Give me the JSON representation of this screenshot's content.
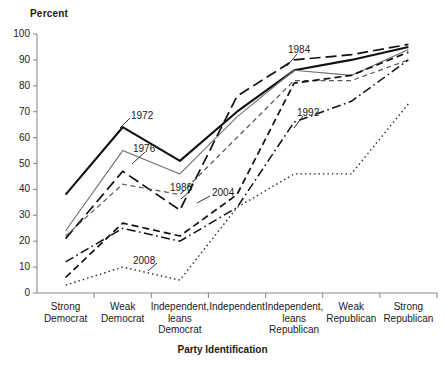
{
  "chart_data": {
    "type": "line",
    "title": "",
    "ylabel": "Percent",
    "xlabel": "Party Identification",
    "ylim": [
      0,
      100
    ],
    "ytick_labels": [
      "100",
      "90",
      "80",
      "70",
      "60",
      "50",
      "40",
      "30",
      "20",
      "10",
      "0"
    ],
    "ytick_values": [
      100,
      90,
      80,
      70,
      60,
      50,
      40,
      30,
      20,
      10,
      0
    ],
    "grid": false,
    "legend_position": "inline-annotations",
    "categories": [
      "Strong\nDemocrat",
      "Weak\nDemocrat",
      "Independent,\nleans\nDemocrat",
      "Independent",
      "Independent,\nleans\nRepublican",
      "Weak\nRepublican",
      "Strong\nRepublican"
    ],
    "category_labels": [
      [
        "Strong",
        "Democrat"
      ],
      [
        "Weak",
        "Democrat"
      ],
      [
        "Independent,",
        "leans",
        "Democrat"
      ],
      [
        "Independent"
      ],
      [
        "Independent,",
        "leans",
        "Republican"
      ],
      [
        "Weak",
        "Republican"
      ],
      [
        "Strong",
        "Republican"
      ]
    ],
    "series": [
      {
        "name": "1972",
        "style": "solid-thick",
        "color": "#111111",
        "values": [
          38,
          64,
          51,
          70,
          86,
          90,
          95
        ]
      },
      {
        "name": "1976",
        "style": "solid-thin-gray",
        "color": "#6e6e6e",
        "values": [
          24,
          55,
          46,
          68,
          86,
          84,
          94
        ]
      },
      {
        "name": "1984",
        "style": "long-dash",
        "color": "#111111",
        "values": [
          21,
          47,
          32,
          76,
          90,
          92,
          96
        ]
      },
      {
        "name": "1988",
        "style": "short-dash",
        "color": "#5a5a5a",
        "values": [
          22,
          42,
          38,
          60,
          82,
          82,
          90
        ]
      },
      {
        "name": "2004",
        "style": "medium-dash",
        "color": "#111111",
        "values": [
          6,
          27,
          22,
          38,
          81,
          84,
          93
        ]
      },
      {
        "name": "1992",
        "style": "dash-dot",
        "color": "#111111",
        "values": [
          12,
          25,
          20,
          33,
          66,
          74,
          90
        ]
      },
      {
        "name": "2008",
        "style": "dotted",
        "color": "#2b2b2b",
        "values": [
          3,
          10,
          5,
          33,
          46,
          46,
          73
        ]
      }
    ],
    "annotations": [
      {
        "label": "1972",
        "x": 131,
        "y": 111
      },
      {
        "label": "1976",
        "x": 133,
        "y": 144
      },
      {
        "label": "1988",
        "x": 170,
        "y": 183
      },
      {
        "label": "2004",
        "x": 212,
        "y": 188
      },
      {
        "label": "1984",
        "x": 288,
        "y": 45
      },
      {
        "label": "1992",
        "x": 297,
        "y": 108
      },
      {
        "label": "2008",
        "x": 133,
        "y": 256
      }
    ]
  }
}
